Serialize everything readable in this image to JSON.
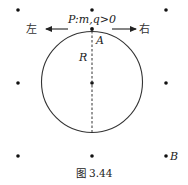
{
  "figure": {
    "caption": "图 3.44",
    "particle_label": "P:m,q>0",
    "point_a_label": "A",
    "radius_label": "R",
    "point_b_label": "B",
    "left_label": "左",
    "right_label": "右",
    "field_dots": "3x3 grid of magnetic field dots (field out of page)",
    "colors": {
      "ink": "#222222"
    }
  }
}
